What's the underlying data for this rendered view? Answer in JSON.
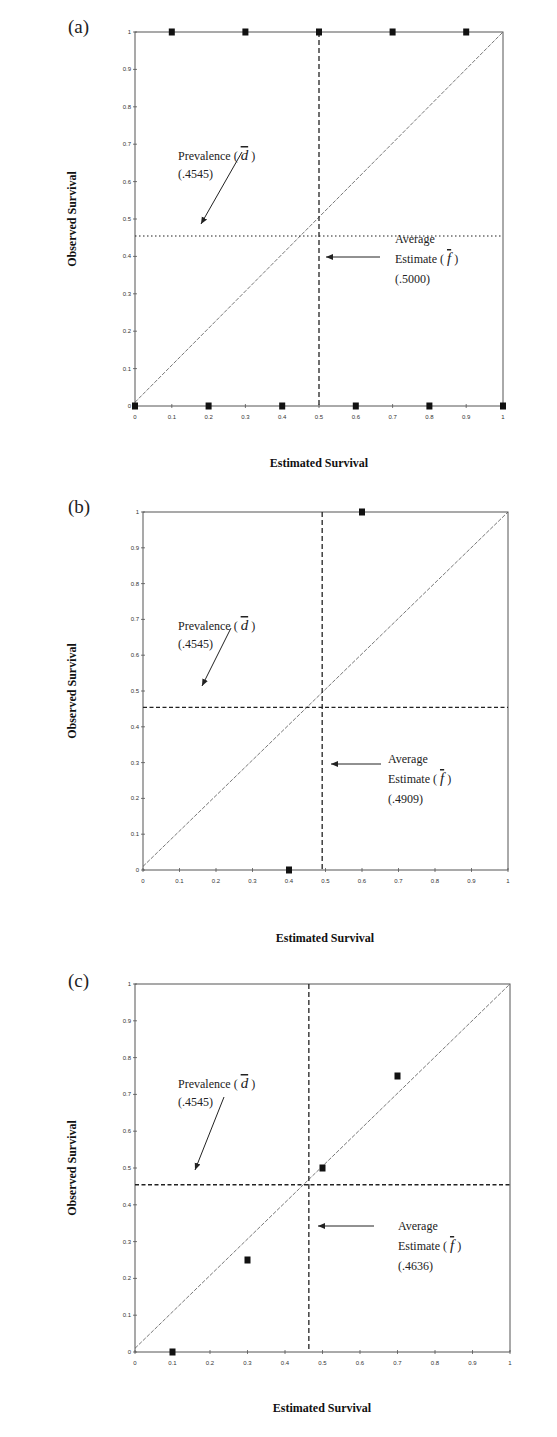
{
  "chart_data": [
    {
      "type": "scatter",
      "panel_label": "(a)",
      "xlabel": "Estimated Survival",
      "ylabel": "Observed Survival",
      "xlim": [
        0,
        1
      ],
      "ylim": [
        0,
        1
      ],
      "x_ticks": [
        "0",
        "0.1",
        "0.2",
        "0.3",
        "0.4",
        "0.5",
        "0.6",
        "0.7",
        "0.8",
        "0.9",
        "1"
      ],
      "y_ticks": [
        "0",
        "0.1",
        "0.2",
        "0.3",
        "0.4",
        "0.5",
        "0.6",
        "0.7",
        "0.8",
        "0.9",
        "1"
      ],
      "points": [
        [
          0,
          0
        ],
        [
          0.2,
          0
        ],
        [
          0.4,
          0
        ],
        [
          0.6,
          0
        ],
        [
          0.8,
          0
        ],
        [
          1,
          0
        ],
        [
          0.1,
          1
        ],
        [
          0.3,
          1
        ],
        [
          0.5,
          1
        ],
        [
          0.7,
          1
        ],
        [
          0.9,
          1
        ]
      ],
      "diagonal": true,
      "prevalence": 0.4545,
      "prevalence_style": "dotted",
      "average_estimate": 0.5,
      "prevalence_label": "Prevalence (",
      "prevalence_symbol": "d",
      "prevalence_value": "(.4545)",
      "avg_label_1": "Average",
      "avg_label_2": "Estimate (",
      "avg_symbol": "f",
      "avg_value": "(.5000)"
    },
    {
      "type": "scatter",
      "panel_label": "(b)",
      "xlabel": "Estimated Survival",
      "ylabel": "Observed Survival",
      "xlim": [
        0,
        1
      ],
      "ylim": [
        0,
        1
      ],
      "x_ticks": [
        "0",
        "0.1",
        "0.2",
        "0.3",
        "0.4",
        "0.5",
        "0.6",
        "0.7",
        "0.8",
        "0.9",
        "1"
      ],
      "y_ticks": [
        "0",
        "0.1",
        "0.2",
        "0.3",
        "0.4",
        "0.5",
        "0.6",
        "0.7",
        "0.8",
        "0.9",
        "1"
      ],
      "points": [
        [
          0.4,
          0
        ],
        [
          0.6,
          1
        ]
      ],
      "diagonal": true,
      "prevalence": 0.4545,
      "prevalence_style": "dashed",
      "average_estimate": 0.4909,
      "prevalence_label": "Prevalence (",
      "prevalence_symbol": "d",
      "prevalence_value": "(.4545)",
      "avg_label_1": "Average",
      "avg_label_2": "Estimate (",
      "avg_symbol": "f",
      "avg_value": "(.4909)"
    },
    {
      "type": "scatter",
      "panel_label": "(c)",
      "xlabel": "Estimated Survival",
      "ylabel": "Observed Survival",
      "xlim": [
        0,
        1
      ],
      "ylim": [
        0,
        1
      ],
      "x_ticks": [
        "0",
        "0.1",
        "0.2",
        "0.3",
        "0.4",
        "0.5",
        "0.6",
        "0.7",
        "0.8",
        "0.9",
        "1"
      ],
      "y_ticks": [
        "0",
        "0.1",
        "0.2",
        "0.3",
        "0.4",
        "0.5",
        "0.6",
        "0.7",
        "0.8",
        "0.9",
        "1"
      ],
      "points": [
        [
          0.1,
          0
        ],
        [
          0.3,
          0.25
        ],
        [
          0.5,
          0.5
        ],
        [
          0.7,
          0.75
        ]
      ],
      "diagonal": true,
      "prevalence": 0.4545,
      "prevalence_style": "dashed",
      "average_estimate": 0.4636,
      "prevalence_label": "Prevalence (",
      "prevalence_symbol": "d",
      "prevalence_value": "(.4545)",
      "avg_label_1": "Average",
      "avg_label_2": "Estimate (",
      "avg_symbol": "f",
      "avg_value": "(.4636)"
    }
  ]
}
